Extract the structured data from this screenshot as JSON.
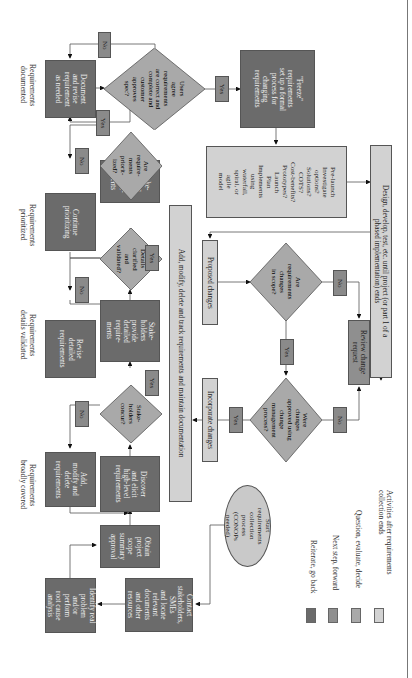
{
  "diagram": {
    "orientation": "rotated 90 degrees clockwise",
    "stage_labels": [
      "Requirements\ndocumented",
      "Requirements\nprioritized",
      "Requirements\ndetails validated",
      "Requirements\nbroadly covered"
    ],
    "start": "Start\nrequirements\ncollection\nprocess\n(CONOPs\nneeded)",
    "boxes": {
      "identify": "Identify real\nproblem\nand/or\nperform\nroot cause\nanalysis",
      "contact": "Contact\nstakeholders,\nSMEs\nand locate\nrelevant\ndocuments\nand other\nresources",
      "obtain": "Obtain\nproject\nscope\nsummary\napproval",
      "add_modify": "Add,\nmodify and\ndelete\nrequirements",
      "discover": "Discover\nand elicit\nhigh-level\nrequirements",
      "revise": "Revise\ndetailed\nrequirements",
      "provide": "Stake-\nholders\nprovide\ndetailed\nrequire-\nments",
      "continue": "Continue\nprioritizing",
      "prioritize": "Stake-\nholders\nprioritize\nrequire-\nments",
      "document": "Document\nand revise\nrequirement\nas needed",
      "freeze": "\"Freeze\"\nrequirements\nset up a formal\nprocess for\nchanging\nrequirements",
      "prelaunch": "Pre-launch\nInvestigate\noptions?\nSolutions?\nCOTS?\nCost-benefits?\nPrototypes?\nLaunch\nPlan\nImplements\nusing\nwaterfall,\nspiral, or\nagile\nmodel",
      "track": "Add, modify, delete and track requirements and maintain documentation",
      "proposed": "Proposed changes",
      "incorporate": "Incorporate changes",
      "review": "Review change\nrequest",
      "design": "Design, develop, test, etc. until project (or part 1 of a\nphased implementation) ends"
    },
    "decisions": {
      "concur": "Stake-\nholders\nconcur?",
      "details": "Details\nclarified\nand\nvalidated?",
      "prioritized": "Are\nrequire-\nments\npriorit-\nized?",
      "users_agree": "Users\nagree\nrequirements\nare correct and\ncomplete and\ncustomer\napproves\nspec?",
      "in_scope": "Are\nrequirements\nchanges\nin scope?",
      "approved": "Were\nchanges\napproved using\nchange\nmanagement\nprocess?"
    },
    "tags": {
      "yes": "Yes",
      "no": "No"
    },
    "legend": [
      {
        "label": "Reiterate, go back",
        "color": "#6b6b6b"
      },
      {
        "label": "Next step, forward",
        "color": "#8f8f8f"
      },
      {
        "label": "Question, evaluate, decide",
        "color": "#a9a9a9"
      },
      {
        "label": "Activities after requirements\ncollection ends",
        "color": "#d2d2d2"
      }
    ]
  }
}
